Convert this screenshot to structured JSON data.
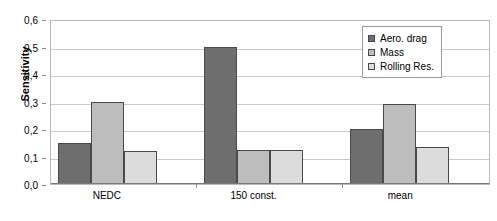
{
  "chart_data": {
    "type": "bar",
    "title": "",
    "subtitle": "",
    "xlabel": "",
    "ylabel": "Sensitivity",
    "categories": [
      "NEDC",
      "150 const.",
      "mean"
    ],
    "series": [
      {
        "name": "Aero. drag",
        "values": [
          0.15,
          0.5,
          0.2
        ],
        "color": "#6e6e6e"
      },
      {
        "name": "Mass",
        "values": [
          0.3,
          0.125,
          0.29
        ],
        "color": "#bdbdbd"
      },
      {
        "name": "Rolling Res.",
        "values": [
          0.12,
          0.125,
          0.135
        ],
        "color": "#dcdcdc"
      }
    ],
    "ylim": [
      0.0,
      0.6
    ],
    "ytick_values": [
      0.0,
      0.1,
      0.2,
      0.3,
      0.4,
      0.5,
      0.6
    ],
    "ytick_labels": [
      "0,0",
      "0,1",
      "0,2",
      "0,3",
      "0,4",
      "0,5",
      "0,6"
    ],
    "grid": "horizontal",
    "legend_position": "top-right",
    "decimal_separator": ","
  },
  "legend": {
    "items": [
      {
        "label": "Aero. drag"
      },
      {
        "label": "Mass"
      },
      {
        "label": "Rolling Res."
      }
    ]
  }
}
